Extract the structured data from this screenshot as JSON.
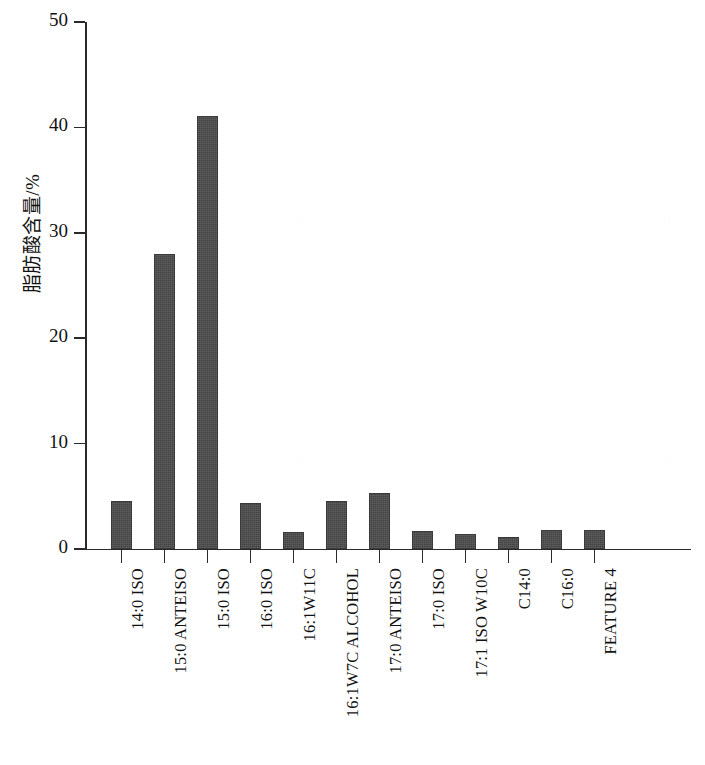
{
  "chart_data": {
    "type": "bar",
    "title": "",
    "xlabel": "",
    "ylabel": "脂肪酸含量/%",
    "ylim": [
      0,
      50
    ],
    "ytick_labels": [
      "0",
      "10",
      "20",
      "30",
      "40",
      "50"
    ],
    "ytick_values": [
      0,
      10,
      20,
      30,
      40,
      50
    ],
    "grid": false,
    "legend": "none",
    "bar_color": "#4d4d4d",
    "axis_color": "#2a2a2a",
    "categories": [
      "14:0 ISO",
      "15:0 ANTEISO",
      "15:0 ISO",
      "16:0 ISO",
      "16:1W11C",
      "16:1W7C ALCOHOL",
      "17:0 ANTEISO",
      "17:0 ISO",
      "17:1 ISO W10C",
      "C14:0",
      "C16:0",
      "FEATURE 4"
    ],
    "values": [
      4.6,
      28.0,
      41.1,
      4.4,
      1.6,
      4.6,
      5.3,
      1.7,
      1.4,
      1.1,
      1.8,
      1.8
    ]
  }
}
